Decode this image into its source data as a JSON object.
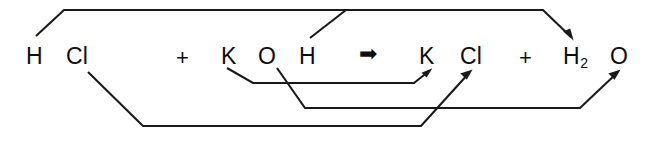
{
  "diagram": {
    "kind": "chemical-reaction-atom-mapping",
    "equation_text": "H Cl + K O H ➡ K Cl + H2 O",
    "stroke_color": "#1a1a1a",
    "text_color": "#0d0d0d",
    "background_color": "#ffffff",
    "reactants": {
      "species": [
        {
          "formula": "HCl",
          "atoms": [
            {
              "symbol": "H",
              "x": 26,
              "y": 45
            },
            {
              "symbol": "Cl",
              "x": 66,
              "y": 45
            }
          ]
        },
        {
          "formula": "KOH",
          "atoms": [
            {
              "symbol": "K",
              "x": 221,
              "y": 45
            },
            {
              "symbol": "O",
              "x": 258,
              "y": 45
            },
            {
              "symbol": "H",
              "x": 299,
              "y": 45
            }
          ]
        }
      ],
      "plus_sign": {
        "label": "+",
        "x": 176,
        "y": 47
      }
    },
    "reaction_arrow": {
      "glyph": "➡",
      "label": "yields",
      "x": 359,
      "y": 44
    },
    "products": {
      "species": [
        {
          "formula": "KCl",
          "atoms": [
            {
              "symbol": "K",
              "x": 419,
              "y": 45
            },
            {
              "symbol": "Cl",
              "x": 460,
              "y": 45
            }
          ]
        },
        {
          "formula": "H2O",
          "atoms": [
            {
              "symbol": "H",
              "subscript": "2",
              "x": 563,
              "y": 45
            },
            {
              "symbol": "O",
              "x": 610,
              "y": 45
            }
          ]
        }
      ],
      "plus_sign": {
        "label": "+",
        "x": 519,
        "y": 47
      }
    },
    "mapping_lines": [
      {
        "name": "h-of-hcl-to-h2o",
        "from_atom": "H (HCl)",
        "to_atom": "H2 (H2O)",
        "route": "above",
        "points": "36,36 64,10 543,10 573,38",
        "arrowhead": true
      },
      {
        "name": "h-of-koh-to-h2o",
        "from_atom": "H (KOH)",
        "to_atom": "H2 (H2O)",
        "route": "above",
        "points": "310,38 346,10",
        "arrowhead": false
      },
      {
        "name": "k-of-koh-to-kcl",
        "from_atom": "K (KOH)",
        "to_atom": "K (KCl)",
        "route": "below",
        "points": "227,68 253,83 414,83 431,70",
        "arrowhead": true
      },
      {
        "name": "o-of-koh-to-h2o",
        "from_atom": "O (KOH)",
        "to_atom": "O (H2O)",
        "route": "below",
        "points": "277,68 305,108 580,108 619,71",
        "arrowhead": true
      },
      {
        "name": "cl-of-hcl-to-kcl",
        "from_atom": "Cl (HCl)",
        "to_atom": "Cl (KCl)",
        "route": "below",
        "points": "88,72 143,126 421,126 471,71",
        "arrowhead": true
      }
    ]
  }
}
